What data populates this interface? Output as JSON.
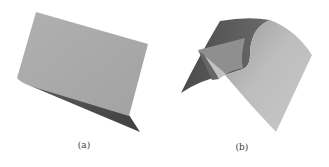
{
  "figure": {
    "subfigures": [
      {
        "id": "a",
        "caption": "(a)",
        "description": "3D rendered surface: a large flat light-gray panel with a darker underside strip",
        "colors": {
          "light_face": "#a9a9a9",
          "dark_face": "#4e4e4e"
        }
      },
      {
        "id": "b",
        "caption": "(b)",
        "description": "3D rendered curved saddle-like surface with a fold",
        "colors": {
          "dark_face": "#5a5a5a",
          "mid_face": "#8c8c8c",
          "light_face": "#b8b8b8",
          "fold_light": "#9e9e9e",
          "fold_pale": "#c4c4c4"
        }
      }
    ]
  }
}
